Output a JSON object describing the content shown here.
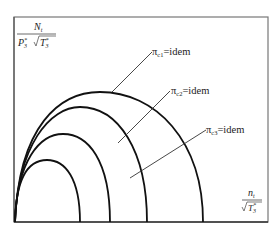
{
  "diagram": {
    "type": "compressor characteristic curves",
    "y_axis": {
      "numerator": "N",
      "numerator_sub": "t",
      "denominator_P": "P",
      "denominator_P_sup": "*",
      "denominator_P_sub": "3",
      "denominator_T": "T",
      "denominator_T_sup": "*",
      "denominator_T_sub": "3"
    },
    "x_axis": {
      "numerator": "n",
      "numerator_sub": "t",
      "denominator_T": "T",
      "denominator_T_sup": "*",
      "denominator_T_sub": "3"
    },
    "curves": [
      {
        "label": "π",
        "sub": "c1",
        "eq": "=idem",
        "text": "πc1=idem"
      },
      {
        "label": "π",
        "sub": "c2",
        "eq": "=idem",
        "text": "πc2=idem"
      },
      {
        "label": "π",
        "sub": "c3",
        "eq": "=idem",
        "text": "πc3=idem"
      }
    ]
  }
}
